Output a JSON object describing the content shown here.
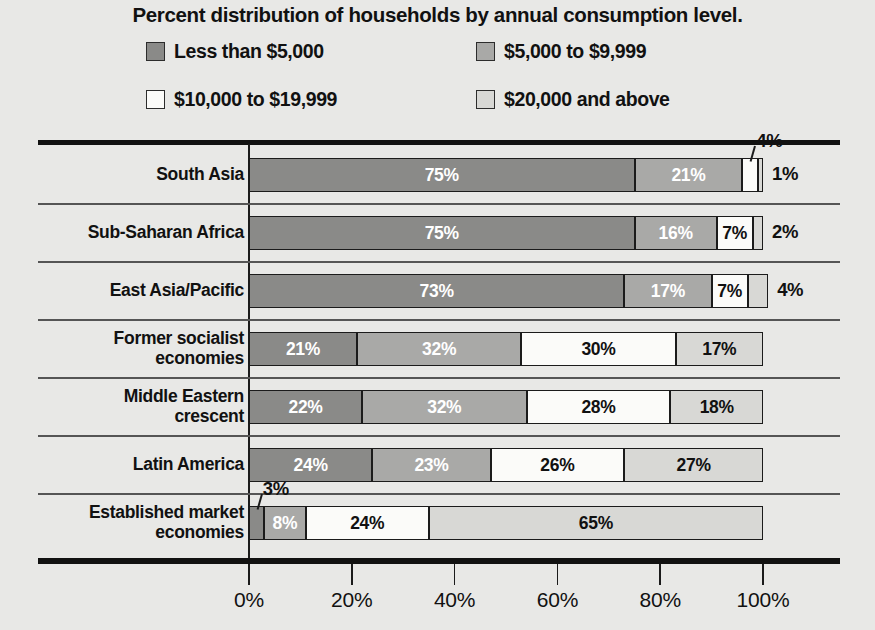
{
  "title": "Percent distribution of households by annual consumption level.",
  "colors": {
    "series1": "#8a8a88",
    "series2": "#a9a9a7",
    "series3": "#fbfbf9",
    "series4": "#d8d8d5",
    "ink": "#111111",
    "background": "#e8e8e6"
  },
  "legend": {
    "items": [
      {
        "label": "Less than $5,000",
        "swatch": "series1"
      },
      {
        "label": "$5,000 to $9,999",
        "swatch": "series2"
      },
      {
        "label": "$10,000 to $19,999",
        "swatch": "series3"
      },
      {
        "label": "$20,000 and above",
        "swatch": "series4"
      }
    ]
  },
  "axis": {
    "ticks": [
      "0%",
      "20%",
      "40%",
      "60%",
      "80%",
      "100%"
    ],
    "min": 0,
    "max": 100
  },
  "rows": [
    {
      "label_lines": [
        "South Asia"
      ],
      "segments": [
        {
          "value": 75,
          "text": "75%",
          "inside": true,
          "label_color": "light"
        },
        {
          "value": 21,
          "text": "21%",
          "inside": true,
          "label_color": "light"
        },
        {
          "value": 3,
          "text": "4%",
          "inside": false,
          "callout": "above"
        },
        {
          "value": 1,
          "text": "1%",
          "inside": false,
          "callout": "right"
        }
      ]
    },
    {
      "label_lines": [
        "Sub-Saharan Africa"
      ],
      "segments": [
        {
          "value": 75,
          "text": "75%",
          "inside": true,
          "label_color": "light"
        },
        {
          "value": 16,
          "text": "16%",
          "inside": true,
          "label_color": "light"
        },
        {
          "value": 7,
          "text": "7%",
          "inside": true,
          "label_color": "dark"
        },
        {
          "value": 2,
          "text": "2%",
          "inside": false,
          "callout": "right"
        }
      ]
    },
    {
      "label_lines": [
        "East Asia/Pacific"
      ],
      "segments": [
        {
          "value": 73,
          "text": "73%",
          "inside": true,
          "label_color": "light"
        },
        {
          "value": 17,
          "text": "17%",
          "inside": true,
          "label_color": "light"
        },
        {
          "value": 7,
          "text": "7%",
          "inside": true,
          "label_color": "dark"
        },
        {
          "value": 4,
          "text": "4%",
          "inside": false,
          "callout": "right"
        }
      ]
    },
    {
      "label_lines": [
        "Former socialist",
        "economies"
      ],
      "segments": [
        {
          "value": 21,
          "text": "21%",
          "inside": true,
          "label_color": "light"
        },
        {
          "value": 32,
          "text": "32%",
          "inside": true,
          "label_color": "light"
        },
        {
          "value": 30,
          "text": "30%",
          "inside": true,
          "label_color": "dark"
        },
        {
          "value": 17,
          "text": "17%",
          "inside": true,
          "label_color": "dark"
        }
      ]
    },
    {
      "label_lines": [
        "Middle Eastern",
        "crescent"
      ],
      "segments": [
        {
          "value": 22,
          "text": "22%",
          "inside": true,
          "label_color": "light"
        },
        {
          "value": 32,
          "text": "32%",
          "inside": true,
          "label_color": "light"
        },
        {
          "value": 28,
          "text": "28%",
          "inside": true,
          "label_color": "dark"
        },
        {
          "value": 18,
          "text": "18%",
          "inside": true,
          "label_color": "dark"
        }
      ]
    },
    {
      "label_lines": [
        "Latin America"
      ],
      "segments": [
        {
          "value": 24,
          "text": "24%",
          "inside": true,
          "label_color": "light"
        },
        {
          "value": 23,
          "text": "23%",
          "inside": true,
          "label_color": "light"
        },
        {
          "value": 26,
          "text": "26%",
          "inside": true,
          "label_color": "dark"
        },
        {
          "value": 27,
          "text": "27%",
          "inside": true,
          "label_color": "dark"
        }
      ]
    },
    {
      "label_lines": [
        "Established market",
        "economies"
      ],
      "segments": [
        {
          "value": 3,
          "text": "3%",
          "inside": false,
          "callout": "above"
        },
        {
          "value": 8,
          "text": "8%",
          "inside": true,
          "label_color": "light"
        },
        {
          "value": 24,
          "text": "24%",
          "inside": true,
          "label_color": "dark"
        },
        {
          "value": 65,
          "text": "65%",
          "inside": true,
          "label_color": "dark"
        }
      ]
    }
  ],
  "chart_data": {
    "type": "bar",
    "orientation": "horizontal",
    "stacked": true,
    "normalized": true,
    "title": "Percent distribution of households by annual consumption level.",
    "xlabel": "",
    "ylabel": "",
    "xlim": [
      0,
      100
    ],
    "xticks": [
      0,
      20,
      40,
      60,
      80,
      100
    ],
    "xtick_labels": [
      "0%",
      "20%",
      "40%",
      "60%",
      "80%",
      "100%"
    ],
    "grid": false,
    "legend_position": "top",
    "categories": [
      "South Asia",
      "Sub-Saharan Africa",
      "East Asia/Pacific",
      "Former socialist economies",
      "Middle Eastern crescent",
      "Latin America",
      "Established market economies"
    ],
    "series": [
      {
        "name": "Less than $5,000",
        "values": [
          75,
          75,
          73,
          21,
          22,
          24,
          3
        ]
      },
      {
        "name": "$5,000 to $9,999",
        "values": [
          21,
          16,
          17,
          32,
          32,
          23,
          8
        ]
      },
      {
        "name": "$10,000 to $19,999",
        "values": [
          4,
          7,
          7,
          30,
          28,
          26,
          24
        ]
      },
      {
        "name": "$20,000 and above",
        "values": [
          1,
          2,
          4,
          17,
          18,
          27,
          65
        ]
      }
    ],
    "data_labels": [
      {
        "category": "South Asia",
        "labels": [
          "75%",
          "21%",
          "4%",
          "1%"
        ]
      },
      {
        "category": "Sub-Saharan Africa",
        "labels": [
          "75%",
          "16%",
          "7%",
          "2%"
        ]
      },
      {
        "category": "East Asia/Pacific",
        "labels": [
          "73%",
          "17%",
          "7%",
          "4%"
        ]
      },
      {
        "category": "Former socialist economies",
        "labels": [
          "21%",
          "32%",
          "30%",
          "17%"
        ]
      },
      {
        "category": "Middle Eastern crescent",
        "labels": [
          "22%",
          "32%",
          "28%",
          "18%"
        ]
      },
      {
        "category": "Latin America",
        "labels": [
          "24%",
          "23%",
          "26%",
          "27%"
        ]
      },
      {
        "category": "Established market economies",
        "labels": [
          "3%",
          "8%",
          "24%",
          "65%"
        ]
      }
    ]
  }
}
